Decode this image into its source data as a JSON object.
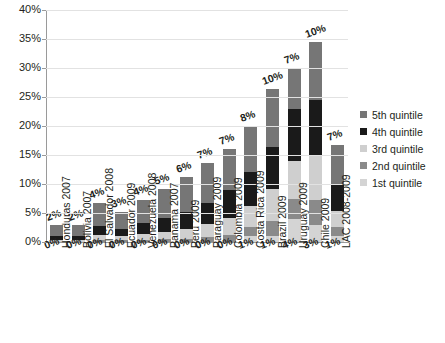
{
  "chart_data": {
    "type": "bar",
    "subtype": "stacked-bar",
    "title": "",
    "subtitle": "",
    "xlabel": "",
    "ylabel": "",
    "ylim": [
      0,
      40
    ],
    "ytick_labels": [
      "0%",
      "5%",
      "10%",
      "15%",
      "20%",
      "25%",
      "30%",
      "35%",
      "40%"
    ],
    "ytick_values": [
      0,
      5,
      10,
      15,
      20,
      25,
      30,
      35,
      40
    ],
    "grid": true,
    "legend_position": "right",
    "categories": [
      "Honduras 2007",
      "Bolivia 2007",
      "El Salvador 2008",
      "Ecuador 2009",
      "Venezuela 2008",
      "Panama 2007",
      "Peru 2009",
      "Paraguay 2009",
      "Colombia 2009",
      "Costa Rica 2009",
      "Brazil 2009",
      "Uruguay 2009",
      "Chile 2009",
      "LAC 2008-2009"
    ],
    "series": [
      {
        "name": "1st quintile",
        "color": "#d4d4d4",
        "values": [
          0,
          0,
          0,
          0,
          0,
          0,
          0,
          0,
          0,
          1,
          1,
          4,
          3,
          1
        ]
      },
      {
        "name": "2nd quintile",
        "color": "#8a8a8a",
        "values": [
          0,
          0,
          0.4,
          0.3,
          0.4,
          0.5,
          0.6,
          0.8,
          1.2,
          1.6,
          2.6,
          3.4,
          4.2,
          1.6
        ]
      },
      {
        "name": "3rd quintile",
        "color": "#cfcfcf",
        "values": [
          0.3,
          0.3,
          0.8,
          0.7,
          1.0,
          1.3,
          1.6,
          2.3,
          3.0,
          3.6,
          5.5,
          6.6,
          7.8,
          2.8
        ]
      },
      {
        "name": "4th quintile",
        "color": "#1a1a1a",
        "values": [
          0.7,
          0.7,
          1.6,
          1.2,
          1.8,
          2.3,
          3.0,
          3.6,
          4.8,
          5.8,
          7.2,
          9.0,
          9.5,
          4.4
        ]
      },
      {
        "name": "5th quintile",
        "color": "#767676",
        "values": [
          2,
          2,
          4,
          3,
          4,
          5,
          6,
          7,
          7,
          8,
          10,
          7,
          10,
          7
        ]
      }
    ],
    "bar_top_labels": [
      "2%",
      "2%",
      "4%",
      "3%",
      "4%",
      "5%",
      "6%",
      "7%",
      "7%",
      "8%",
      "10%",
      "7%",
      "10%",
      "7%"
    ],
    "bar_bottom_labels": [
      "0%",
      "0%",
      "0%",
      "0%",
      "0%",
      "0%",
      "0%",
      "0%",
      "0%",
      "1%",
      "1%",
      "4%",
      "3%",
      "1%"
    ],
    "legend_entries": [
      {
        "label": "5th quintile",
        "color": "#767676"
      },
      {
        "label": "4th quintile",
        "color": "#1a1a1a"
      },
      {
        "label": "3rd quintile",
        "color": "#cfcfcf"
      },
      {
        "label": "2nd quintile",
        "color": "#8a8a8a"
      },
      {
        "label": "1st quintile",
        "color": "#d4d4d4"
      }
    ]
  }
}
